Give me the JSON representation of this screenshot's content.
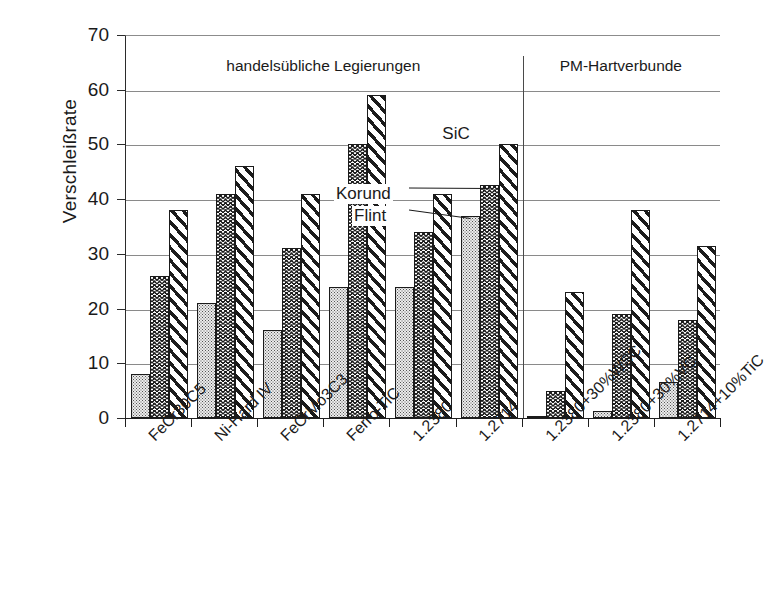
{
  "chart_data": {
    "type": "bar",
    "title": "",
    "xlabel": "",
    "ylabel": "Verschleißrate",
    "ylim": [
      0,
      70
    ],
    "yticks": [
      0,
      10,
      20,
      30,
      40,
      50,
      60,
      70
    ],
    "grid": "horizontal",
    "legend_position": "inline-annotations",
    "categories": [
      "FeCr30C5",
      "Ni-Hard IV",
      "FeCrMo3C3",
      "Ferro-TiC",
      "1.2380",
      "1.2714",
      "1.2380+30%WSC",
      "1.2380+30%VC",
      "1.2714+10%TiC"
    ],
    "series": [
      {
        "name": "Flint",
        "pattern": "dotted",
        "values": [
          8,
          21,
          16,
          24,
          24,
          37,
          0.3,
          1.3,
          6.5
        ]
      },
      {
        "name": "Korund",
        "pattern": "herringbone",
        "values": [
          26,
          41,
          31,
          50,
          34,
          42.5,
          5,
          19,
          18
        ]
      },
      {
        "name": "SiC",
        "pattern": "diagonal",
        "values": [
          38,
          46,
          41,
          59,
          41,
          50,
          23,
          38,
          31.5
        ]
      }
    ],
    "annotations": [
      {
        "text": "SiC",
        "points_to": {
          "category": "1.2714",
          "series": "SiC"
        }
      },
      {
        "text": "Korund",
        "points_to": {
          "category": "1.2714",
          "series": "Korund"
        }
      },
      {
        "text": "Flint",
        "points_to": {
          "category": "1.2714",
          "series": "Flint"
        }
      }
    ],
    "sections": [
      {
        "label": "handelsübliche Legierungen",
        "categories": [
          "FeCr30C5",
          "Ni-Hard IV",
          "FeCrMo3C3",
          "Ferro-TiC",
          "1.2380",
          "1.2714"
        ]
      },
      {
        "label": "PM-Hartverbunde",
        "categories": [
          "1.2380+30%WSC",
          "1.2380+30%VC",
          "1.2714+10%TiC"
        ]
      }
    ],
    "colors": {
      "axis": "#1f1f1f",
      "grid": "#8a8a8a",
      "bar_outline": "#1b1b1b",
      "flint_fill": "#ececec",
      "text": "#1a1a1a"
    }
  }
}
